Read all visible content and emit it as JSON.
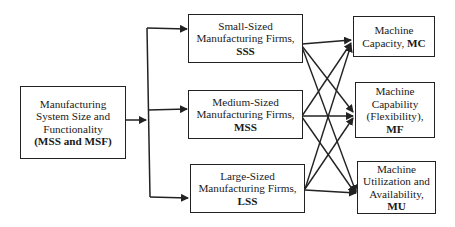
{
  "diagram": {
    "source": {
      "line1": "Manufacturing",
      "line2": "System Size and",
      "line3": "Functionality",
      "abbr": "(MSS and MSF)"
    },
    "firms": [
      {
        "line1": "Small-Sized",
        "line2": "Manufacturing Firms,",
        "abbr": "SSS"
      },
      {
        "line1": "Medium-Sized",
        "line2": "Manufacturing Firms,",
        "abbr": "MSS"
      },
      {
        "line1": "Large-Sized",
        "line2": "Manufacturing Firms,",
        "abbr": "LSS"
      }
    ],
    "outcomes": [
      {
        "line1": "Machine",
        "line2": "Capacity,",
        "abbr": "MC"
      },
      {
        "line1": "Machine",
        "line2": "Capability",
        "line3": "(Flexibility),",
        "abbr": "MF"
      },
      {
        "line1": "Machine",
        "line2": "Utilization and",
        "line3": "Availability,",
        "abbr": "MU"
      }
    ],
    "edges": [
      [
        "source",
        "SSS"
      ],
      [
        "source",
        "MSS"
      ],
      [
        "source",
        "LSS"
      ],
      [
        "SSS",
        "MC"
      ],
      [
        "SSS",
        "MF"
      ],
      [
        "SSS",
        "MU"
      ],
      [
        "MSS",
        "MC"
      ],
      [
        "MSS",
        "MF"
      ],
      [
        "MSS",
        "MU"
      ],
      [
        "LSS",
        "MC"
      ],
      [
        "LSS",
        "MF"
      ],
      [
        "LSS",
        "MU"
      ]
    ],
    "colors": {
      "line": "#222222",
      "background": "#ffffff"
    }
  }
}
